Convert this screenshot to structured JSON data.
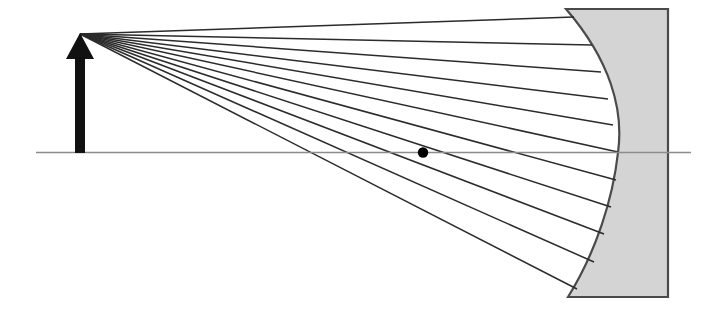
{
  "figure": {
    "title": "Concave mirror ray diagram",
    "width": 709,
    "height": 319,
    "background_color": "#ffffff"
  },
  "colors": {
    "ray_stroke": "#2b2b2b",
    "axis_stroke": "#8c8c8c",
    "mirror_fill": "#d4d4d4",
    "mirror_stroke": "#4a4a4a",
    "object_arrow_fill": "#111111",
    "focal_point_fill": "#000000"
  },
  "optical_axis": {
    "label": "principal axis",
    "x1": 36,
    "y1": 152.5,
    "x2": 691,
    "y2": 152.5,
    "stroke_width": 1.6
  },
  "object_arrow": {
    "label": "object arrow",
    "tip_x": 80,
    "tip_y": 33,
    "base_x": 80,
    "base_y": 153,
    "shaft_half_width": 5,
    "head_half_width": 14,
    "head_height": 26
  },
  "focal_point": {
    "label": "focal point",
    "cx": 423,
    "cy": 152.5,
    "r": 5.2
  },
  "mirror": {
    "label": "concave mirror",
    "top_y": 9,
    "bottom_y": 297,
    "back_x": 668,
    "top_left_x": 566,
    "bottom_left_x": 568,
    "vertex_x": 618,
    "vertex_y": 152.5,
    "stroke_width": 2.2
  },
  "rays": {
    "label": "incident rays from object tip",
    "count": 11,
    "origin_x": 80,
    "origin_y": 34,
    "stroke_width": 1.5,
    "hit_points": [
      {
        "x": 574,
        "y": 17
      },
      {
        "x": 592,
        "y": 45
      },
      {
        "x": 601,
        "y": 72
      },
      {
        "x": 608,
        "y": 99
      },
      {
        "x": 613,
        "y": 125
      },
      {
        "x": 618,
        "y": 152
      },
      {
        "x": 616,
        "y": 180
      },
      {
        "x": 611,
        "y": 207
      },
      {
        "x": 604,
        "y": 234
      },
      {
        "x": 594,
        "y": 262
      },
      {
        "x": 577,
        "y": 289
      }
    ]
  },
  "chart_data": {
    "type": "scatter",
    "title": "Concave mirror ray diagram",
    "xlabel": "",
    "ylabel": "",
    "series": [
      {
        "name": "incident rays",
        "x": [
          574,
          592,
          601,
          608,
          613,
          618,
          616,
          611,
          604,
          594,
          577
        ],
        "y": [
          17,
          45,
          72,
          99,
          125,
          152,
          180,
          207,
          234,
          262,
          289
        ]
      }
    ],
    "annotations": [
      "object arrow at x = 80",
      "focal point at x = 423 on axis",
      "mirror vertex at x = 618 on axis"
    ]
  }
}
